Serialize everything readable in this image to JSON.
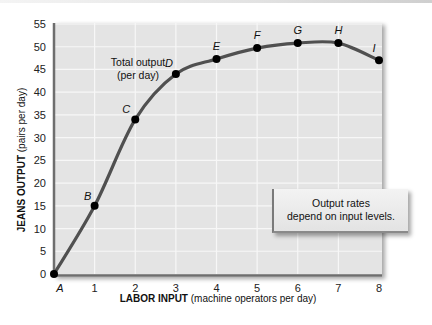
{
  "chart_data": {
    "type": "line",
    "title": "",
    "xlabel_bold": "LABOR INPUT",
    "xlabel_rest": " (machine operators per day)",
    "ylabel_bold": "JEANS OUTPUT",
    "ylabel_rest": " (pairs per day)",
    "x": [
      0,
      1,
      2,
      3,
      4,
      5,
      6,
      7,
      8
    ],
    "x_tick_labels": [
      "A",
      "1",
      "2",
      "3",
      "4",
      "5",
      "6",
      "7",
      "8"
    ],
    "y_ticks": [
      0,
      5,
      10,
      15,
      20,
      25,
      30,
      35,
      40,
      45,
      50,
      55
    ],
    "xlim": [
      0,
      8
    ],
    "ylim": [
      0,
      55
    ],
    "grid": true,
    "series": [
      {
        "name": "Total output (per day)",
        "values": [
          0,
          15,
          34,
          44,
          47.3,
          49.7,
          50.8,
          50.8,
          47
        ],
        "point_labels": [
          "A",
          "B",
          "C",
          "D",
          "E",
          "F",
          "G",
          "H",
          "I"
        ]
      }
    ],
    "annotations": {
      "curve_label_line1": "Total output",
      "curve_label_line2": "(per day)",
      "callout_line1": "Output rates",
      "callout_line2": "depend on input levels."
    }
  }
}
